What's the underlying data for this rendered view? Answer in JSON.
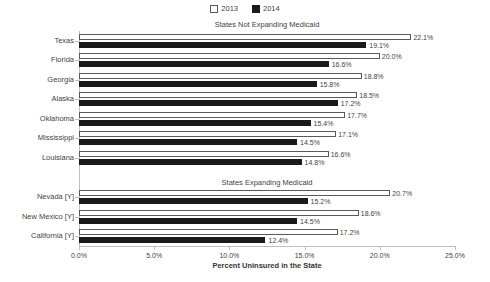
{
  "chart_data": {
    "type": "bar",
    "orientation": "horizontal",
    "title": "",
    "xlabel": "Percent Uninsured in the State",
    "ylabel": "",
    "xlim": [
      0.0,
      25.0
    ],
    "xtick_labels": [
      "0.0%",
      "5.0%",
      "10.0%",
      "15.0%",
      "20.0%",
      "25.0%"
    ],
    "xtick_values": [
      0.0,
      5.0,
      10.0,
      15.0,
      20.0,
      25.0
    ],
    "grid": false,
    "legend_position": "top-center",
    "legend": [
      {
        "name": "2013",
        "swatch": "hollow",
        "color": "#ffffff",
        "border": "#595959"
      },
      {
        "name": "2014",
        "swatch": "solid",
        "color": "#1a1a1a",
        "border": "#1a1a1a"
      }
    ],
    "series": [
      {
        "name": "2013",
        "values": [
          22.1,
          20.0,
          18.8,
          18.5,
          17.7,
          17.1,
          16.6,
          20.7,
          18.6,
          17.2
        ]
      },
      {
        "name": "2014",
        "values": [
          19.1,
          16.6,
          15.8,
          17.2,
          15.4,
          14.5,
          14.8,
          15.2,
          14.5,
          12.4
        ]
      }
    ],
    "categories": [
      "Texas",
      "Florida",
      "Georgia",
      "Alaska",
      "Oklahoma",
      "Mississippi",
      "Louisiana",
      "Nevada [Y]",
      "New Mexico [Y]",
      "California [Y]"
    ],
    "groups": [
      {
        "title": "States Not Expanding Medicaid",
        "rows": [
          {
            "category": "Texas",
            "v2013": 22.1,
            "v2014": 19.1,
            "label2013": "22.1%",
            "label2014": "19.1%"
          },
          {
            "category": "Florida",
            "v2013": 20.0,
            "v2014": 16.6,
            "label2013": "20.0%",
            "label2014": "16.6%"
          },
          {
            "category": "Georgia",
            "v2013": 18.8,
            "v2014": 15.8,
            "label2013": "18.8%",
            "label2014": "15.8%"
          },
          {
            "category": "Alaska",
            "v2013": 18.5,
            "v2014": 17.2,
            "label2013": "18.5%",
            "label2014": "17.2%"
          },
          {
            "category": "Oklahoma",
            "v2013": 17.7,
            "v2014": 15.4,
            "label2013": "17.7%",
            "label2014": "15.4%"
          },
          {
            "category": "Mississippi",
            "v2013": 17.1,
            "v2014": 14.5,
            "label2013": "17.1%",
            "label2014": "14.5%"
          },
          {
            "category": "Louisiana",
            "v2013": 16.6,
            "v2014": 14.8,
            "label2013": "16.6%",
            "label2014": "14.8%"
          }
        ]
      },
      {
        "title": "States Expanding Medicaid",
        "rows": [
          {
            "category": "Nevada [Y]",
            "v2013": 20.7,
            "v2014": 15.2,
            "label2013": "20.7%",
            "label2014": "15.2%"
          },
          {
            "category": "New Mexico [Y]",
            "v2013": 18.6,
            "v2014": 14.5,
            "label2013": "18.6%",
            "label2014": "14.5%"
          },
          {
            "category": "California [Y]",
            "v2013": 17.2,
            "v2014": 12.4,
            "label2013": "17.2%",
            "label2014": "12.4%"
          }
        ]
      }
    ]
  }
}
